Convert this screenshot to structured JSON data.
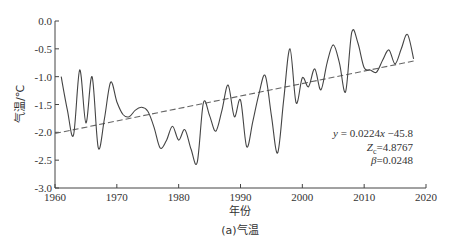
{
  "chart_data": {
    "type": "line",
    "title": "",
    "caption": "(a)气温",
    "xlabel": "年份",
    "ylabel": "气温/℃",
    "xlim": [
      1960,
      2020
    ],
    "ylim": [
      -3.0,
      0.0
    ],
    "xticks": [
      1960,
      1970,
      1980,
      1990,
      2000,
      2010,
      2020
    ],
    "yticks": [
      0.0,
      -0.5,
      -1.0,
      -1.5,
      -2.0,
      -2.5,
      -3.0
    ],
    "ytick_labels": [
      "0.0",
      "-0.5",
      "-1.0",
      "-1.5",
      "-2.0",
      "-2.5",
      "-3.0"
    ],
    "xtick_labels": [
      "1960",
      "1970",
      "1980",
      "1990",
      "2000",
      "2010",
      "2020"
    ],
    "grid": false,
    "legend": null,
    "series": [
      {
        "name": "气温",
        "style": "solid",
        "color": "#444444",
        "x": [
          1961,
          1962,
          1963,
          1964,
          1965,
          1966,
          1967,
          1968,
          1969,
          1970,
          1971,
          1972,
          1973,
          1974,
          1975,
          1976,
          1977,
          1978,
          1979,
          1980,
          1981,
          1982,
          1983,
          1984,
          1985,
          1986,
          1987,
          1988,
          1989,
          1990,
          1991,
          1992,
          1993,
          1994,
          1995,
          1996,
          1997,
          1998,
          1999,
          2000,
          2001,
          2002,
          2003,
          2004,
          2005,
          2006,
          2007,
          2008,
          2009,
          2010,
          2011,
          2012,
          2013,
          2014,
          2015,
          2016,
          2017,
          2018
        ],
        "y": [
          -1.0,
          -1.6,
          -2.05,
          -0.88,
          -1.83,
          -1.0,
          -2.28,
          -1.75,
          -1.1,
          -1.45,
          -1.68,
          -1.72,
          -1.6,
          -1.55,
          -1.62,
          -1.9,
          -2.28,
          -2.15,
          -1.89,
          -2.14,
          -1.95,
          -2.3,
          -2.54,
          -1.47,
          -1.7,
          -1.98,
          -1.6,
          -1.15,
          -1.72,
          -1.42,
          -2.26,
          -1.8,
          -1.3,
          -0.98,
          -1.7,
          -2.37,
          -1.4,
          -0.5,
          -1.47,
          -1.02,
          -1.18,
          -0.86,
          -1.24,
          -0.75,
          -0.43,
          -0.75,
          -1.27,
          -0.2,
          -0.4,
          -0.84,
          -0.88,
          -0.92,
          -0.7,
          -0.52,
          -0.77,
          -0.5,
          -0.24,
          -0.68
        ]
      },
      {
        "name": "线性趋势",
        "style": "dashed",
        "color": "#666666",
        "x": [
          1960,
          2018
        ],
        "y": [
          -2.02,
          -0.72
        ]
      }
    ],
    "annotations": [
      {
        "text": "y = 0.0224x −45.8",
        "x": 2013,
        "y": -2.05
      },
      {
        "text": "Zc=4.8767",
        "x": 2013,
        "y": -2.28
      },
      {
        "text": "β=0.0248",
        "x": 2013,
        "y": -2.5
      }
    ]
  }
}
